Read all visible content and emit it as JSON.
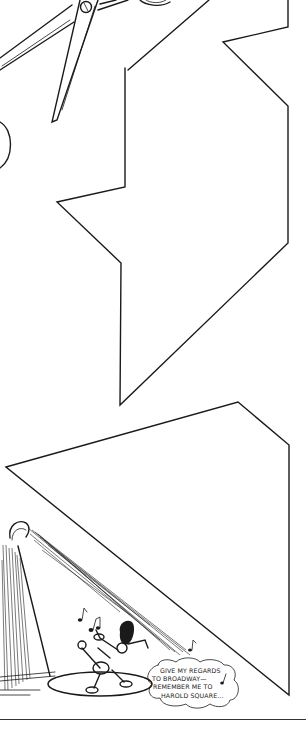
{
  "illustration": {
    "description": "Line drawing of scissors cutting out paper shapes; a spotlight shines on a singing character",
    "shapes": [
      "scissors",
      "zigzag-polygon-shape",
      "triangle-shape",
      "spotlight",
      "singing-character",
      "speech-bubble"
    ],
    "speech_bubble": {
      "lines": [
        "GIVE MY REGARDS",
        "TO BROADWAY—",
        "REMEMBER ME TO",
        "HAROLD SQUARE..."
      ]
    },
    "music_notes": 4,
    "colors": {
      "ink": "#1a1a1a",
      "paper": "#ffffff"
    }
  }
}
